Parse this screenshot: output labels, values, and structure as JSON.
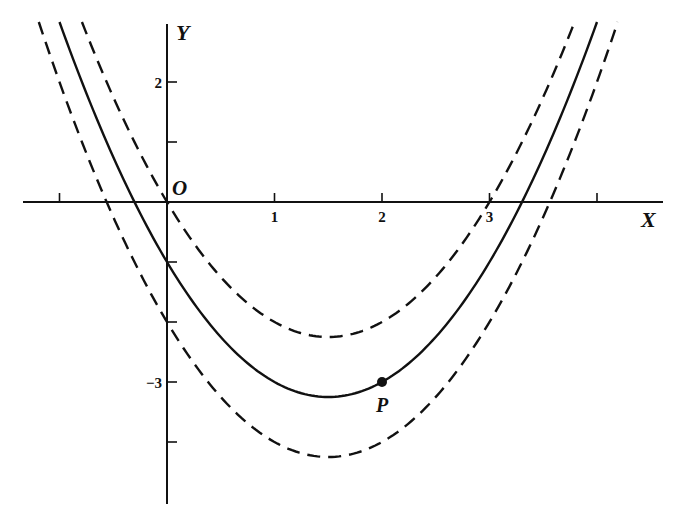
{
  "figure": {
    "title": "",
    "axes": {
      "x_label": "X",
      "y_label": "Y",
      "origin_label": "O",
      "x_ticks": [
        -1,
        1,
        2,
        3,
        4
      ],
      "x_tick_labels": [
        "",
        "1",
        "2",
        "3",
        ""
      ],
      "y_ticks": [
        2,
        1,
        -1,
        -2,
        -3,
        -4
      ],
      "y_tick_labels": [
        "2",
        "",
        "",
        "",
        "−3",
        ""
      ],
      "x_range": [
        -1.34,
        4.61
      ],
      "y_range": [
        -5.03,
        2.97
      ]
    },
    "point": {
      "label": "P",
      "x": 2,
      "y": -3
    },
    "colors": {
      "ink": "#111111",
      "background": "#ffffff"
    }
  },
  "chart_data": {
    "type": "line",
    "title": "",
    "xlabel": "X",
    "ylabel": "Y",
    "xlim": [
      -1.34,
      4.61
    ],
    "ylim": [
      -5.03,
      2.97
    ],
    "grid": false,
    "legend": "none",
    "series": [
      {
        "name": "y = x² − 3x (dashed)",
        "style": "dashed",
        "equation": "y = x^2 - 3x",
        "vertex": [
          1.5,
          -2.25
        ],
        "x_intercepts": [
          0,
          3
        ]
      },
      {
        "name": "y = x² − 3x − 1 (solid)",
        "style": "solid",
        "equation": "y = x^2 - 3x - 1",
        "vertex": [
          1.5,
          -3.25
        ],
        "y_intercept": -1
      },
      {
        "name": "y = x² − 3x − 2 (dashed)",
        "style": "dashed",
        "equation": "y = x^2 - 3x - 2",
        "vertex": [
          1.5,
          -4.25
        ],
        "y_intercept": -2
      }
    ],
    "annotations": [
      {
        "text": "P",
        "x": 2,
        "y": -3,
        "marker": "filled-circle"
      },
      {
        "text": "O",
        "x": 0,
        "y": 0
      }
    ]
  }
}
